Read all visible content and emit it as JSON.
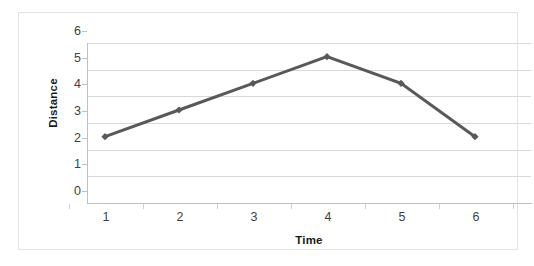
{
  "chart_data": {
    "type": "line",
    "title": "",
    "xlabel": "Time",
    "ylabel": "Distance",
    "x": [
      1,
      2,
      3,
      4,
      5,
      6
    ],
    "categories": [
      "1",
      "2",
      "3",
      "4",
      "5",
      "6"
    ],
    "values": [
      2,
      3,
      4,
      5,
      4,
      2
    ],
    "series": [
      {
        "name": "Distance",
        "values": [
          2,
          3,
          4,
          5,
          4,
          2
        ],
        "color": "#595959",
        "marker": "diamond",
        "line_width": 3
      }
    ],
    "xlim": [
      0.5,
      6.5
    ],
    "ylim": [
      0,
      6
    ],
    "y_ticks": [
      0,
      1,
      2,
      3,
      4,
      5,
      6
    ],
    "y_tick_labels": [
      "0",
      "1",
      "2",
      "3",
      "4",
      "5",
      "6"
    ],
    "x_ticks": [
      1,
      2,
      3,
      4,
      5,
      6
    ],
    "x_tick_labels": [
      "1",
      "2",
      "3",
      "4",
      "5",
      "6"
    ],
    "grid": "horizontal",
    "legend": "none",
    "plot_background": "#ffffff",
    "gridline_color": "#d9d9d9",
    "axis_color": "#bfbfbf",
    "border_color": "#e3e3e3"
  }
}
